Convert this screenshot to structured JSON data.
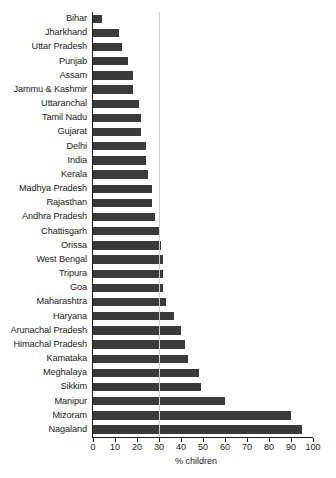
{
  "chart_data": {
    "type": "bar",
    "orientation": "horizontal",
    "title": "",
    "subtitle": "",
    "xlabel": "% children",
    "ylabel": "",
    "xlim": [
      0,
      100
    ],
    "xticks": [
      0,
      10,
      20,
      30,
      40,
      50,
      60,
      70,
      80,
      90,
      100
    ],
    "xtick_labels": [
      "0",
      "10",
      "20",
      "30",
      "40",
      "50",
      "60",
      "70",
      "80",
      "90",
      "100"
    ],
    "grid": "single vertical reference line at 30",
    "legend": "none",
    "bar_color": "#3a3a3a",
    "categories": [
      "Bihar",
      "Jharkhand",
      "Uttar Pradesh",
      "Punjab",
      "Assam",
      "Jammu & Kashmir",
      "Uttaranchal",
      "Tamil Nadu",
      "Gujarat",
      "Delhi",
      "India",
      "Kerala",
      "Madhya Pradesh",
      "Rajasthan",
      "Andhra Pradesh",
      "Chattisgarh",
      "Orissa",
      "West Bengal",
      "Tripura",
      "Goa",
      "Maharashtra",
      "Haryana",
      "Arunachal Pradesh",
      "Himachal Pradesh",
      "Kamataka",
      "Meghalaya",
      "Sikkim",
      "Manipur",
      "Mizoram",
      "Nagaland"
    ],
    "values": [
      4,
      12,
      13,
      16,
      18,
      18,
      21,
      22,
      22,
      24,
      24,
      25,
      27,
      27,
      28,
      30,
      31,
      32,
      32,
      32,
      33,
      37,
      40,
      42,
      43,
      48,
      49,
      60,
      90,
      95
    ]
  },
  "axis": {
    "x_title": "% children"
  }
}
